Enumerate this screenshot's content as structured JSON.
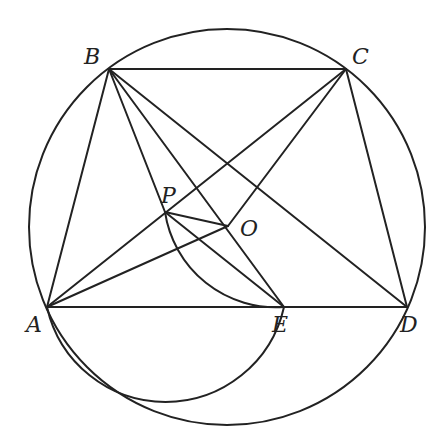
{
  "diagram": {
    "type": "geometry",
    "stroke_color": "#222222",
    "background": "#ffffff",
    "circle": {
      "center": [
        227,
        227
      ],
      "radius": 198
    },
    "points": {
      "A": {
        "label": "A",
        "x": 47,
        "y": 307,
        "label_x": 26,
        "label_y": 314
      },
      "B": {
        "label": "B",
        "x": 109,
        "y": 69,
        "label_x": 84,
        "label_y": 46
      },
      "C": {
        "label": "C",
        "x": 346,
        "y": 69,
        "label_x": 352,
        "label_y": 46
      },
      "D": {
        "label": "D",
        "x": 407,
        "y": 307,
        "label_x": 400,
        "label_y": 314
      },
      "E": {
        "label": "E",
        "x": 284,
        "y": 307,
        "label_x": 272,
        "label_y": 314
      },
      "P": {
        "label": "P",
        "x": 165,
        "y": 212,
        "label_x": 161,
        "label_y": 185
      },
      "O": {
        "label": "O",
        "x": 228,
        "y": 226,
        "label_x": 240,
        "label_y": 218
      }
    },
    "segments": [
      [
        "A",
        "B"
      ],
      [
        "B",
        "C"
      ],
      [
        "C",
        "D"
      ],
      [
        "A",
        "D"
      ],
      [
        "A",
        "C"
      ],
      [
        "B",
        "D"
      ],
      [
        "B",
        "E"
      ],
      [
        "B",
        "P"
      ],
      [
        "P",
        "E"
      ],
      [
        "P",
        "O"
      ],
      [
        "A",
        "O"
      ],
      [
        "C",
        "O"
      ]
    ],
    "arcs": [
      {
        "name": "arc-APE",
        "through": [
          "A",
          "P",
          "E"
        ]
      },
      {
        "name": "arc-POE",
        "through": [
          "P",
          "O",
          "E"
        ]
      }
    ]
  }
}
